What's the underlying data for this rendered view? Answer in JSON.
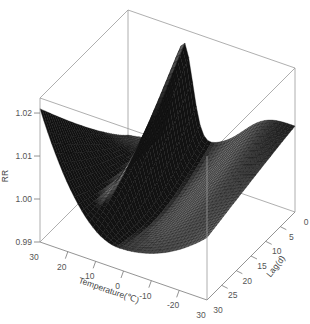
{
  "chart_data": {
    "type": "surface3d",
    "title": "",
    "zlabel": "RR",
    "xlabel": "Temperature(℃)",
    "ylabel": "Lag(d)",
    "x_ticks": [
      30,
      20,
      10,
      0,
      -10,
      -20,
      -30
    ],
    "x_tick_labels": [
      "30",
      "20",
      "10",
      "0",
      "-10",
      "-20",
      "30"
    ],
    "y_ticks": [
      0,
      5,
      10,
      15,
      20,
      25,
      30
    ],
    "y_tick_labels": [
      "0",
      "5",
      "10",
      "15",
      "20",
      "25",
      "30"
    ],
    "z_ticks": [
      0.99,
      1.0,
      1.01,
      1.02
    ],
    "z_tick_labels": [
      "0.99",
      "1.00",
      "1.01",
      "1.02"
    ],
    "xlim": [
      -30,
      30
    ],
    "ylim": [
      0,
      30
    ],
    "zlim": [
      0.99,
      1.0235
    ],
    "grid": false,
    "surface_description": "Exposure-lag-response surface of relative risk (RR) by temperature and lag days. At long lags (~30 d) RR is U-shaped in temperature (≈1.02 at 30℃, ≈0.995 near 0℃). At lag 0 a sharp peak (≈1.023) occurs near 10℃ and a broad high ridge (≈1.015) appears toward -30℃.",
    "sample_points": [
      {
        "temp": 30,
        "lag": 30,
        "rr": 1.021
      },
      {
        "temp": 10,
        "lag": 30,
        "rr": 0.996
      },
      {
        "temp": 0,
        "lag": 30,
        "rr": 0.995
      },
      {
        "temp": -30,
        "lag": 30,
        "rr": 1.002
      },
      {
        "temp": 30,
        "lag": 0,
        "rr": 0.998
      },
      {
        "temp": 10,
        "lag": 0,
        "rr": 1.023
      },
      {
        "temp": -20,
        "lag": 0,
        "rr": 1.016
      },
      {
        "temp": -30,
        "lag": 0,
        "rr": 1.014
      }
    ]
  },
  "colors": {
    "mesh_dark": "#1a1a1a",
    "mesh_light": "#9a9a9a",
    "box": "#9a9a9a",
    "text": "#555555"
  }
}
